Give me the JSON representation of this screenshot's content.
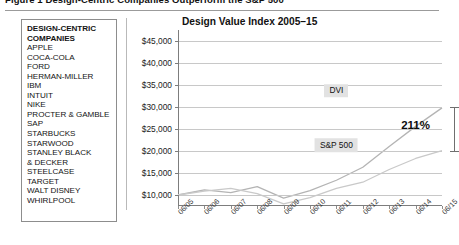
{
  "figure": {
    "caption": "Figure 1  Design-Centric Companies Outperform the S&P 500"
  },
  "company_panel": {
    "heading_line1": "DESIGN-CENTRIC",
    "heading_line2": "COMPANIES",
    "companies": [
      "APPLE",
      "COCA-COLA",
      "FORD",
      "HERMAN-MILLER",
      "IBM",
      "INTUIT",
      "NIKE",
      "PROCTER & GAMBLE",
      "SAP",
      "STARBUCKS",
      "STARWOOD",
      "STANLEY BLACK",
      "& DECKER",
      "STEELCASE",
      "TARGET",
      "WALT DISNEY",
      "WHIRLPOOL"
    ]
  },
  "chart_data": {
    "type": "line",
    "title": "Design Value Index 2005–15",
    "xlabel": "",
    "ylabel": "",
    "grid": true,
    "legend_position": "inline-annotations",
    "x": [
      "06/05",
      "06/06",
      "06/07",
      "06/08",
      "06/09",
      "06/10",
      "06/11",
      "06/12",
      "06/13",
      "06/14",
      "06/15"
    ],
    "ylim": [
      7500,
      47500
    ],
    "yticks": [
      10000,
      15000,
      20000,
      25000,
      30000,
      35000,
      40000,
      45000
    ],
    "ytick_labels": [
      "$10,000",
      "$15,000",
      "$20,000",
      "$25,000",
      "$30,000",
      "$35,000",
      "$40,000",
      "$45,000"
    ],
    "series": [
      {
        "name": "DVI",
        "color": "#b4b4b4",
        "values": [
          10000,
          11150,
          10550,
          11900,
          9300,
          11000,
          13350,
          16300,
          21000,
          25600,
          29800
        ]
      },
      {
        "name": "S&P 500",
        "color": "#c9c9c9",
        "values": [
          10000,
          10900,
          11500,
          10300,
          8000,
          9400,
          11500,
          12900,
          15800,
          18300,
          20100
        ]
      }
    ],
    "annotations": [
      {
        "text": "DVI",
        "x": "06/11",
        "y": 33700,
        "style": "boxed"
      },
      {
        "text": "S&P 500",
        "x": "06/11",
        "y": 21300,
        "style": "boxed"
      },
      {
        "text": "211%",
        "x": "06/14",
        "y": 26000,
        "style": "bold"
      }
    ],
    "bracket": {
      "top": 30000,
      "bottom": 20100,
      "x": "06/15"
    }
  }
}
